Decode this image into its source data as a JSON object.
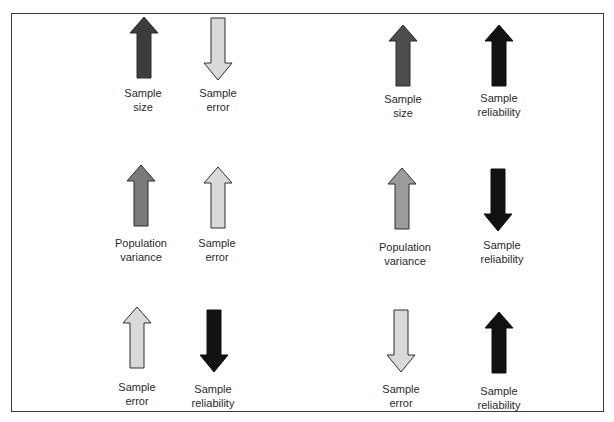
{
  "diagram": {
    "colors": {
      "black": "#111111",
      "dark_gray": "#3c3c3c",
      "dim_gray": "#4d4d4d",
      "medium_gray": "#7a7a7a",
      "medium_light_gray": "#9b9b9b",
      "light_gray": "#d9d9d9",
      "outline": "#2c2c2c"
    },
    "panels": [
      {
        "id": "top-left",
        "items": [
          {
            "label_line1": "Sample",
            "label_line2": "size",
            "direction": "up",
            "shade": "dark_gray"
          },
          {
            "label_line1": "Sample",
            "label_line2": "error",
            "direction": "down",
            "shade": "light_gray"
          }
        ]
      },
      {
        "id": "top-right",
        "items": [
          {
            "label_line1": "Sample",
            "label_line2": "size",
            "direction": "up",
            "shade": "dim_gray"
          },
          {
            "label_line1": "Sample",
            "label_line2": "reliability",
            "direction": "up",
            "shade": "black"
          }
        ]
      },
      {
        "id": "middle-left",
        "items": [
          {
            "label_line1": "Population",
            "label_line2": "variance",
            "direction": "up",
            "shade": "medium_gray"
          },
          {
            "label_line1": "Sample",
            "label_line2": "error",
            "direction": "up",
            "shade": "light_gray"
          }
        ]
      },
      {
        "id": "middle-right",
        "items": [
          {
            "label_line1": "Population",
            "label_line2": "variance",
            "direction": "up",
            "shade": "medium_light_gray"
          },
          {
            "label_line1": "Sample",
            "label_line2": "reliability",
            "direction": "down",
            "shade": "black"
          }
        ]
      },
      {
        "id": "bottom-left",
        "items": [
          {
            "label_line1": "Sample",
            "label_line2": "error",
            "direction": "up",
            "shade": "light_gray"
          },
          {
            "label_line1": "Sample",
            "label_line2": "reliability",
            "direction": "down",
            "shade": "black"
          }
        ]
      },
      {
        "id": "bottom-right",
        "items": [
          {
            "label_line1": "Sample",
            "label_line2": "error",
            "direction": "down",
            "shade": "light_gray"
          },
          {
            "label_line1": "Sample",
            "label_line2": "reliability",
            "direction": "up",
            "shade": "black"
          }
        ]
      }
    ]
  }
}
